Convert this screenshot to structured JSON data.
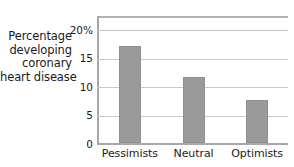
{
  "chart_data": {
    "type": "bar",
    "title": "",
    "subtitle": "",
    "xlabel": "",
    "ylabel": "Percentage developing coronary heart disease",
    "ylabel_lines": [
      "Percentage",
      "developing",
      "coronary",
      "heart disease"
    ],
    "categories": [
      "Pessimists",
      "Neutral",
      "Optimists"
    ],
    "values": [
      17.2,
      11.8,
      7.8
    ],
    "ylim": [
      0,
      22.5
    ],
    "yticks": [
      0,
      5,
      10,
      15,
      20
    ],
    "ytick_labels": [
      "0",
      "5",
      "10",
      "15",
      "20%"
    ],
    "grid": true,
    "grid_axis": "y",
    "legend": false,
    "legend_position": "none",
    "bar_color": "#9a9a9a",
    "grid_color": "#c9c9c9",
    "axis_color": "#a8a8a8",
    "text_color": "#1a1a1a",
    "background": "#ffffff"
  }
}
